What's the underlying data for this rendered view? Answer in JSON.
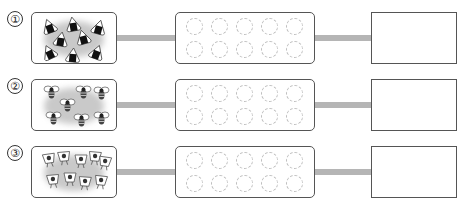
{
  "worksheet": {
    "rows": [
      {
        "number": "①",
        "object": "onigiri-rice-ball",
        "count": 8,
        "frame_circles": 10,
        "answer": ""
      },
      {
        "number": "②",
        "object": "bee",
        "count": 7,
        "frame_circles": 10,
        "answer": ""
      },
      {
        "number": "③",
        "object": "ice-cream-cone",
        "count": 9,
        "frame_circles": 10,
        "answer": ""
      }
    ]
  },
  "colors": {
    "connector": "#b5b5b5",
    "border": "#555555",
    "dashed_circle": "#bdbdbd",
    "blob": "#c9c9c9"
  }
}
